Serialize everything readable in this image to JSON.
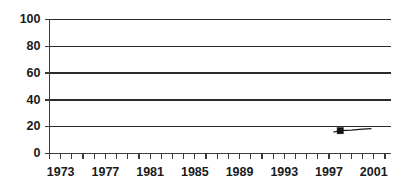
{
  "chart_data": {
    "type": "line",
    "title": "",
    "subtitle": "",
    "xlabel": "",
    "ylabel": "",
    "ylim": [
      0,
      100
    ],
    "xlim": [
      1972,
      2002.5
    ],
    "grid": true,
    "legend": false,
    "legend_position": "none",
    "y_ticks": [
      0,
      20,
      40,
      60,
      80,
      100
    ],
    "y_tick_labels": [
      "0",
      "20",
      "40",
      "60",
      "80",
      "100"
    ],
    "x_tick_labels": [
      "1973",
      "1977",
      "1981",
      "1985",
      "1989",
      "1993",
      "1997",
      "2001"
    ],
    "x_tick_label_years": [
      1973,
      1977,
      1981,
      1985,
      1989,
      1993,
      1997,
      2001
    ],
    "x_minor_tick_years": [
      1972,
      1973,
      1974,
      1975,
      1976,
      1977,
      1978,
      1979,
      1980,
      1981,
      1982,
      1983,
      1984,
      1985,
      1986,
      1987,
      1988,
      1989,
      1990,
      1991,
      1992,
      1993,
      1994,
      1995,
      1996,
      1997,
      1998,
      1999,
      2000,
      2001,
      2002
    ],
    "series": [
      {
        "name": "series-1",
        "marker": "square",
        "color": "#111111",
        "x": [
          1997.4,
          1998.0,
          1999.0,
          2000.0,
          2000.8
        ],
        "values": [
          16.0,
          17.0,
          17.5,
          18.2,
          18.6
        ],
        "marker_points": [
          {
            "x": 1998.0,
            "y": 17.0
          }
        ]
      }
    ],
    "annotations": []
  },
  "axes": {
    "y_axis_name": "y-axis",
    "x_axis_name": "x-axis"
  }
}
